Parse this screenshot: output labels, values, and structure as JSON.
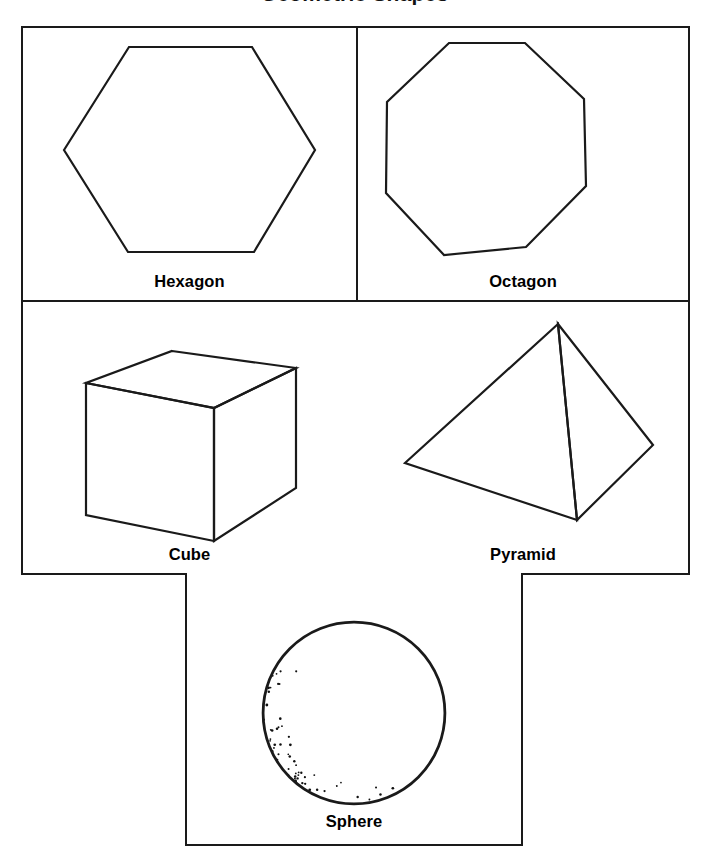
{
  "page": {
    "title": "Geometric Shapes",
    "background_color": "#ffffff",
    "stroke_color": "#1a1a1a",
    "text_color": "#000000"
  },
  "diagram": {
    "type": "shape-reference-chart",
    "layout": "2x2 grid with one centered cell below",
    "cells": [
      {
        "id": "hexagon",
        "label": "Hexagon",
        "shape": "hexagon",
        "dimensionality": "2D",
        "sides": 6,
        "orientation": "pointy-left-right (flat top)",
        "fill": "none",
        "stroke": "#1a1a1a"
      },
      {
        "id": "octagon",
        "label": "Octagon",
        "shape": "octagon",
        "dimensionality": "2D",
        "sides": 8,
        "orientation": "flat top",
        "fill": "none",
        "stroke": "#1a1a1a"
      },
      {
        "id": "cube",
        "label": "Cube",
        "shape": "cube",
        "dimensionality": "3D",
        "faces": 6,
        "orientation": "isometric, top and front-left faces visible",
        "fill": "none",
        "stroke": "#1a1a1a"
      },
      {
        "id": "pyramid",
        "label": "Pyramid",
        "shape": "pyramid",
        "dimensionality": "3D",
        "faces": 5,
        "orientation": "square base, two faces visible, apex at top",
        "fill": "none",
        "stroke": "#1a1a1a"
      },
      {
        "id": "sphere",
        "label": "Sphere",
        "shape": "sphere",
        "dimensionality": "3D",
        "orientation": "stippled shading on lower-left crescent",
        "fill": "none",
        "stroke": "#1a1a1a"
      }
    ]
  }
}
